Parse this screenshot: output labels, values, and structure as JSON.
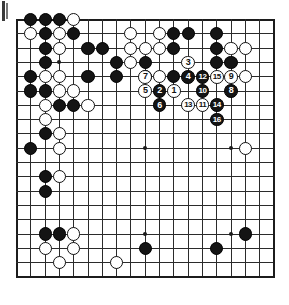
{
  "document": {
    "type": "go-game-diagram",
    "title": "Go board position diagram",
    "corner_mark": "page-binding-mark"
  },
  "board": {
    "size": 19,
    "left": 16.5,
    "top": 19.5,
    "spacing": 14.3,
    "background_color": "#ffffff",
    "line_color": "#2b2b2b",
    "edge_color": "#1c1c1c",
    "black_color": "#141414",
    "white_color": "#ffffff",
    "star_points": [
      [
        4,
        4
      ],
      [
        10,
        4
      ],
      [
        16,
        4
      ],
      [
        4,
        10
      ],
      [
        10,
        10
      ],
      [
        16,
        10
      ],
      [
        4,
        16
      ],
      [
        10,
        16
      ],
      [
        16,
        16
      ]
    ],
    "stone_radius": 6.6
  },
  "stones": {
    "black": [
      [
        2,
        1
      ],
      [
        3,
        1
      ],
      [
        4,
        1
      ],
      [
        3,
        2
      ],
      [
        5,
        2
      ],
      [
        12,
        2
      ],
      [
        13,
        2
      ],
      [
        15,
        2
      ],
      [
        3,
        3
      ],
      [
        6,
        3
      ],
      [
        7,
        3
      ],
      [
        12,
        3
      ],
      [
        15,
        3
      ],
      [
        3,
        4
      ],
      [
        8,
        4
      ],
      [
        10,
        4
      ],
      [
        15,
        4
      ],
      [
        16,
        4
      ],
      [
        2,
        5
      ],
      [
        6,
        5
      ],
      [
        8,
        5
      ],
      [
        10,
        5
      ],
      [
        12,
        5
      ],
      [
        2,
        6
      ],
      [
        3,
        6
      ],
      [
        4,
        7
      ],
      [
        5,
        7
      ],
      [
        3,
        9
      ],
      [
        2,
        10
      ],
      [
        3,
        12
      ],
      [
        3,
        13
      ],
      [
        3,
        16
      ],
      [
        4,
        16
      ],
      [
        17,
        16
      ],
      [
        10,
        17
      ],
      [
        15,
        17
      ]
    ],
    "white": [
      [
        5,
        1
      ],
      [
        2,
        2
      ],
      [
        4,
        2
      ],
      [
        9,
        2
      ],
      [
        11,
        2
      ],
      [
        4,
        3
      ],
      [
        9,
        3
      ],
      [
        10,
        3
      ],
      [
        11,
        3
      ],
      [
        16,
        3
      ],
      [
        17,
        3
      ],
      [
        9,
        4
      ],
      [
        3,
        5
      ],
      [
        4,
        5
      ],
      [
        11,
        5
      ],
      [
        17,
        5
      ],
      [
        4,
        6
      ],
      [
        5,
        6
      ],
      [
        3,
        7
      ],
      [
        6,
        7
      ],
      [
        3,
        8
      ],
      [
        4,
        9
      ],
      [
        4,
        10
      ],
      [
        17,
        10
      ],
      [
        4,
        12
      ],
      [
        5,
        16
      ],
      [
        3,
        17
      ],
      [
        5,
        17
      ],
      [
        4,
        18
      ],
      [
        8,
        18
      ]
    ]
  },
  "moves": [
    {
      "n": 1,
      "color": "white",
      "col": 12,
      "row": 6
    },
    {
      "n": 2,
      "color": "black",
      "col": 11,
      "row": 6
    },
    {
      "n": 3,
      "color": "white",
      "col": 13,
      "row": 4
    },
    {
      "n": 4,
      "color": "black",
      "col": 13,
      "row": 5
    },
    {
      "n": 5,
      "color": "white",
      "col": 10,
      "row": 6
    },
    {
      "n": 6,
      "color": "black",
      "col": 11,
      "row": 7
    },
    {
      "n": 7,
      "color": "white",
      "col": 10,
      "row": 5
    },
    {
      "n": 8,
      "color": "black",
      "col": 16,
      "row": 6
    },
    {
      "n": 9,
      "color": "white",
      "col": 16,
      "row": 5
    },
    {
      "n": 10,
      "color": "black",
      "col": 14,
      "row": 6
    },
    {
      "n": 11,
      "color": "white",
      "col": 14,
      "row": 7
    },
    {
      "n": 12,
      "color": "black",
      "col": 14,
      "row": 5
    },
    {
      "n": 13,
      "color": "white",
      "col": 13,
      "row": 7
    },
    {
      "n": 14,
      "color": "black",
      "col": 15,
      "row": 7
    },
    {
      "n": 15,
      "color": "white",
      "col": 15,
      "row": 5
    },
    {
      "n": 16,
      "color": "black",
      "col": 15,
      "row": 8
    }
  ]
}
